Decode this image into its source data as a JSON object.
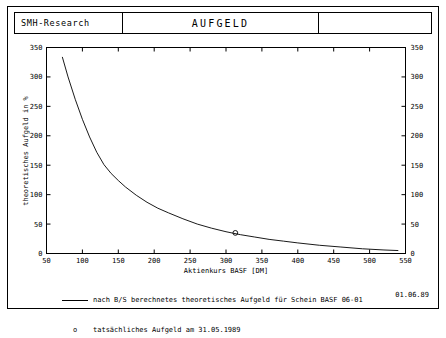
{
  "header": {
    "left_title": "SMH-Research",
    "center_title": "AUFGELD",
    "right_title": ""
  },
  "footer": {
    "legend_line_text": "nach B/S berechnetes theoretisches Aufgeld für Schein BASF 06-01",
    "legend_marker_symbol": "o",
    "legend_marker_text": "tatsächliches Aufgeld am 31.05.1989",
    "date": "01.06.89"
  },
  "chart_data": {
    "type": "line",
    "title": "AUFGELD",
    "xlabel": "Aktienkurs BASF [DM]",
    "ylabel": "theoretisches Aufgeld in %",
    "xlim": [
      50,
      550
    ],
    "ylim": [
      0,
      350
    ],
    "xticks": [
      50,
      100,
      150,
      200,
      250,
      300,
      350,
      400,
      450,
      500,
      550
    ],
    "yticks": [
      0,
      50,
      100,
      150,
      200,
      250,
      300,
      350
    ],
    "yticks_right": [
      0,
      50,
      100,
      150,
      200,
      250,
      300,
      350
    ],
    "grid": false,
    "series": [
      {
        "name": "nach B/S berechnetes theoretisches Aufgeld für Schein BASF 06-01",
        "x": [
          72,
          80,
          90,
          100,
          110,
          120,
          130,
          140,
          150,
          160,
          175,
          190,
          205,
          220,
          240,
          260,
          280,
          300,
          320,
          340,
          360,
          380,
          400,
          430,
          460,
          490,
          520,
          540
        ],
        "y": [
          334,
          300,
          262,
          228,
          198,
          172,
          151,
          136,
          124,
          113,
          99,
          87,
          77,
          69,
          59,
          50,
          43,
          37,
          32,
          28,
          24,
          21,
          18,
          14,
          11,
          8,
          6,
          5
        ]
      }
    ],
    "points": [
      {
        "label": "tatsächliches Aufgeld am 31.05.1989",
        "x": 313,
        "y": 35,
        "marker": "o"
      }
    ]
  }
}
